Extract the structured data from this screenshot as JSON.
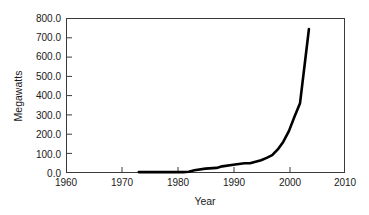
{
  "chart_data": {
    "type": "line",
    "title": "",
    "subtitle": "",
    "xlabel": "Year",
    "ylabel": "Megawatts",
    "xlim": [
      1960,
      2010
    ],
    "ylim": [
      0,
      800
    ],
    "grid": false,
    "legend": null,
    "legend_position": "none",
    "line_color": "#000000",
    "x_ticks": [
      1960,
      1970,
      1980,
      1990,
      2000,
      2010
    ],
    "x_tick_labels": [
      "1960",
      "1970",
      "1980",
      "1990",
      "2000",
      "2010"
    ],
    "y_ticks": [
      0,
      100,
      200,
      300,
      400,
      500,
      600,
      700,
      800
    ],
    "y_tick_labels": [
      "0.0",
      "100.0",
      "200.0",
      "300.0",
      "400.0",
      "500.0",
      "600.0",
      "700.0",
      "800.0"
    ],
    "series": [
      {
        "name": "Installed capacity",
        "x": [
          1973,
          1976,
          1979,
          1981,
          1982,
          1983,
          1985,
          1987,
          1988,
          1990,
          1991,
          1992,
          1993,
          1994,
          1995,
          1996,
          1997,
          1998,
          1999,
          2000,
          2001,
          2002,
          2003,
          2003.6
        ],
        "values": [
          2,
          2,
          2,
          2,
          4,
          12,
          20,
          24,
          32,
          40,
          44,
          48,
          48,
          56,
          64,
          76,
          90,
          120,
          160,
          215,
          290,
          360,
          600,
          745
        ]
      }
    ],
    "annotations": []
  },
  "axes": {
    "x_axis_name": "year-axis",
    "y_axis_name": "megawatts-axis"
  }
}
